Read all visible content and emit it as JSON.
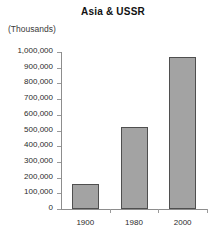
{
  "chart_data": {
    "type": "bar",
    "title": "Asia & USSR",
    "unit_label": "(Thousands)",
    "xlabel": "",
    "ylabel": "",
    "categories": [
      "1900",
      "1980",
      "2000"
    ],
    "values": [
      160000,
      520000,
      965000
    ],
    "series": [
      {
        "name": "Population",
        "values": [
          160000,
          520000,
          965000
        ]
      }
    ],
    "ylim": [
      0,
      1000000
    ],
    "ytick_values": [
      0,
      100000,
      200000,
      300000,
      400000,
      500000,
      600000,
      700000,
      800000,
      900000,
      1000000
    ],
    "ytick_labels": [
      "1,000,000",
      "900,000",
      "800,000",
      "700,000",
      "600,000",
      "500,000",
      "400,000",
      "300,000",
      "200,000",
      "100,000",
      "0"
    ],
    "grid": false,
    "legend": false,
    "bar_fill_color": "#a3a3a3",
    "bar_border_color": "#4f4f4f",
    "axis_color": "#8d8d8d"
  }
}
